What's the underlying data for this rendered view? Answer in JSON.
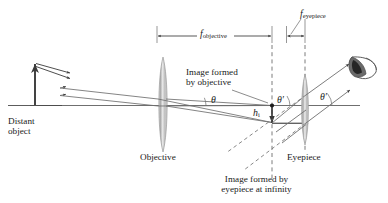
{
  "figure": {
    "type": "optics-ray-diagram",
    "background_color": "#ffffff",
    "line_color": "#3a3a3a",
    "text_color": "#1a1a1a",
    "lens_fill_color": "#b9b9b9"
  },
  "dimensions": {
    "f_objective": {
      "symbol": "f",
      "subscript": "objective"
    },
    "f_eyepiece": {
      "symbol": "f",
      "subscript": "eyepiece"
    }
  },
  "labels": {
    "distant_object": "Distant\nobject",
    "distant_object_line1": "Distant",
    "distant_object_line2": "object",
    "objective": "Objective",
    "eyepiece": "Eyepiece",
    "image_by_objective_line1": "Image formed",
    "image_by_objective_line2": "by objective",
    "image_at_infinity_line1": "Image formed by",
    "image_at_infinity_line2": "eyepiece at infinity"
  },
  "angles": {
    "theta": "θ",
    "theta_prime_inner": "θ′",
    "theta_prime_outer": "θ′"
  },
  "heights": {
    "image_height": {
      "symbol": "h",
      "subscript": "i"
    }
  },
  "elements": {
    "eye_icon": "eye-icon",
    "object_arrow": "upward-arrow",
    "image_arrow": "downward-arrow"
  }
}
